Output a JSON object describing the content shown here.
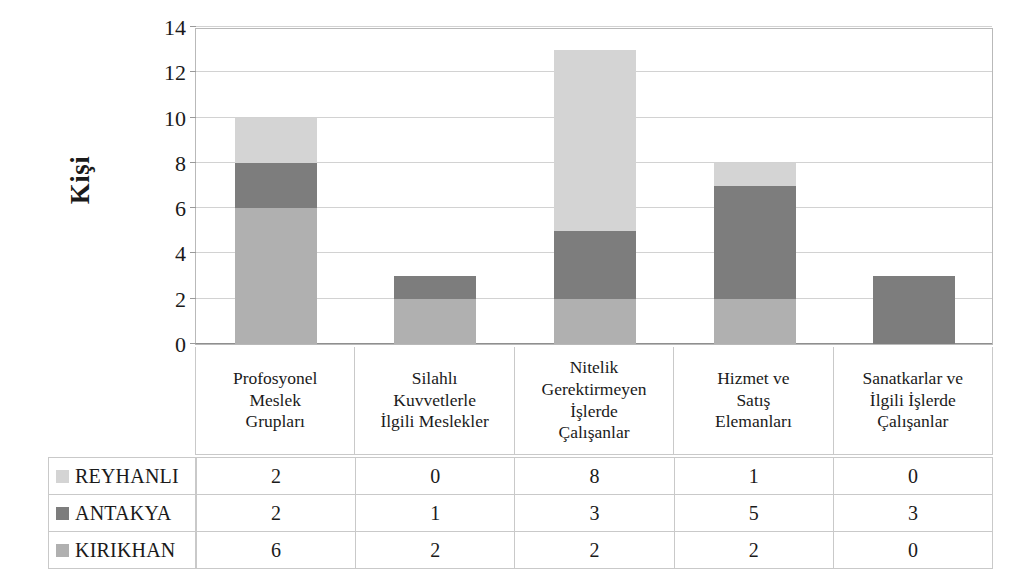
{
  "chart_data": {
    "type": "bar",
    "subtype": "stacked-column",
    "title": "",
    "xlabel": "",
    "ylabel": "Kişi",
    "ylim": [
      0,
      14
    ],
    "yticks": [
      0,
      2,
      4,
      6,
      8,
      10,
      12,
      14
    ],
    "grid": true,
    "legend_position": "data-table-left",
    "categories": [
      "Profosyonel Meslek Grupları",
      "Silahlı Kuvvetlerle İlgili Meslekler",
      "Nitelik Gerektirmeyen İşlerde Çalışanlar",
      "Hizmet ve Satış Elemanları",
      "Sanatkarlar ve İlgili İşlerde Çalışanlar"
    ],
    "category_lines": [
      [
        "Profosyonel",
        "Meslek",
        "Grupları"
      ],
      [
        "Silahlı",
        "Kuvvetlerle",
        "İlgili Meslekler"
      ],
      [
        "Nitelik",
        "Gerektirmeyen",
        "İşlerde",
        "Çalışanlar"
      ],
      [
        "Hizmet ve",
        "Satış",
        "Elemanları"
      ],
      [
        "Sanatkarlar ve",
        "İlgili İşlerde",
        "Çalışanlar"
      ]
    ],
    "series": [
      {
        "name": "KIRIKHAN",
        "values": [
          6,
          2,
          2,
          2,
          0
        ],
        "color": "#b0b0b0",
        "stack_order": 0
      },
      {
        "name": "ANTAKYA",
        "values": [
          2,
          1,
          3,
          5,
          3
        ],
        "color": "#7d7d7d",
        "stack_order": 1
      },
      {
        "name": "REYHANLI",
        "values": [
          2,
          0,
          8,
          1,
          0
        ],
        "color": "#d4d4d4",
        "stack_order": 2
      }
    ],
    "stack_totals": [
      10,
      3,
      13,
      8,
      3
    ]
  },
  "axis": {
    "y_title": "Kişi",
    "y_tick_labels": [
      "14",
      "12",
      "10",
      "8",
      "6",
      "4",
      "2",
      "0"
    ]
  },
  "data_table": {
    "rows": [
      {
        "name": "REYHANLI",
        "swatch": "legend-swatch-reyhanli",
        "values": [
          "2",
          "0",
          "8",
          "1",
          "0"
        ]
      },
      {
        "name": "ANTAKYA",
        "swatch": "legend-swatch-antakya",
        "values": [
          "2",
          "1",
          "3",
          "5",
          "3"
        ]
      },
      {
        "name": "KIRIKHAN",
        "swatch": "legend-swatch-kirikhan",
        "values": [
          "6",
          "2",
          "2",
          "2",
          "0"
        ]
      }
    ]
  },
  "colors": {
    "series_kirikhan": "#b0b0b0",
    "series_antakya": "#7d7d7d",
    "series_reyhanli": "#d4d4d4",
    "gridline": "#d2d2d2",
    "border": "#c9c9c9",
    "text": "#1a1a1a"
  }
}
